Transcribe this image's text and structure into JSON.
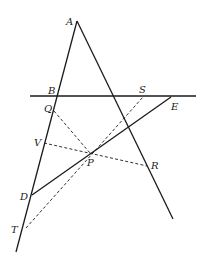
{
  "diagram": {
    "type": "geometry-figure",
    "labels": {
      "A": "A",
      "B": "B",
      "S": "S",
      "E": "E",
      "Q": "Q",
      "V": "V",
      "P": "P",
      "R": "R",
      "D": "D",
      "T": "T"
    },
    "solid_lines": [
      "line through A, B, Q, V, D, T",
      "line through A and R",
      "horizontal line through B, S",
      "segment D-P-E"
    ],
    "dashed_lines": [
      "Q-P-R... (Q to P)",
      "V-P-R",
      "T-P-S"
    ],
    "stroke_color": "#1a1a1a",
    "background": "#ffffff"
  }
}
